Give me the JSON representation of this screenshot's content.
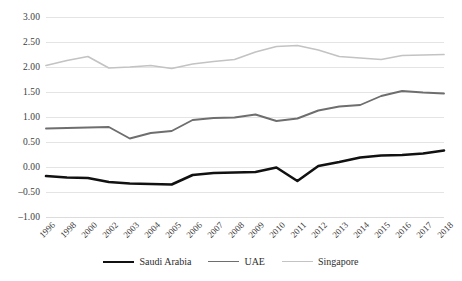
{
  "chart_data": {
    "type": "line",
    "title": "",
    "xlabel": "",
    "ylabel": "",
    "ylim": [
      -1.0,
      3.0
    ],
    "ytick_step": 0.5,
    "grid": true,
    "legend_position": "bottom",
    "ytick_labels": [
      "3.00",
      "2.50",
      "2.00",
      "1.50",
      "1.00",
      "0.50",
      "0.00",
      "-0.50",
      "-1.00"
    ],
    "ytick_values": [
      3.0,
      2.5,
      2.0,
      1.5,
      1.0,
      0.5,
      0.0,
      -0.5,
      -1.0
    ],
    "categories": [
      "1996",
      "1998",
      "2000",
      "2002",
      "2003",
      "2004",
      "2005",
      "2006",
      "2007",
      "2008",
      "2009",
      "2010",
      "2011",
      "2012",
      "2013",
      "2014",
      "2015",
      "2016",
      "2017",
      "2018"
    ],
    "series": [
      {
        "name": "Saudi Arabia",
        "color": "#111111",
        "width": 2.6,
        "values": [
          -0.18,
          -0.21,
          -0.22,
          -0.3,
          -0.33,
          -0.34,
          -0.35,
          -0.16,
          -0.12,
          -0.11,
          -0.1,
          -0.01,
          -0.28,
          0.02,
          0.1,
          0.19,
          0.23,
          0.24,
          0.27,
          0.33
        ]
      },
      {
        "name": "UAE",
        "color": "#6e6e6e",
        "width": 1.9,
        "values": [
          0.77,
          0.78,
          0.79,
          0.8,
          0.57,
          0.68,
          0.72,
          0.94,
          0.98,
          0.99,
          1.05,
          0.92,
          0.97,
          1.13,
          1.21,
          1.24,
          1.42,
          1.52,
          1.49,
          1.47
        ]
      },
      {
        "name": "Singapore",
        "color": "#c3c3c3",
        "width": 1.7,
        "values": [
          2.03,
          2.13,
          2.21,
          1.98,
          2.0,
          2.03,
          1.97,
          2.06,
          2.11,
          2.15,
          2.3,
          2.41,
          2.43,
          2.34,
          2.21,
          2.18,
          2.15,
          2.23,
          2.24,
          2.25
        ]
      }
    ]
  }
}
